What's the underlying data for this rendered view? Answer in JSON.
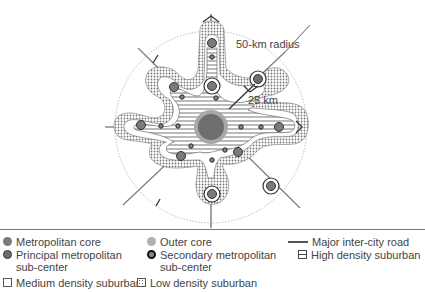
{
  "diagram": {
    "labels": {
      "outer_radius": "50-km radius",
      "inner_radius": "25 km"
    },
    "colors": {
      "metropolitan_core": "#6e6e6e",
      "outer_core": "#a8a8a8",
      "principal_subcenter": "#7a7a7a",
      "road": "#555555",
      "hatch": "#666666",
      "dots": "#888888"
    }
  },
  "legend": {
    "items": [
      {
        "label": "Metropolitan core",
        "icon": "grey-filled-circle"
      },
      {
        "label": "Outer core",
        "icon": "light-grey-circle"
      },
      {
        "label": "Major inter-city road",
        "icon": "horizontal-line"
      },
      {
        "label": "Principal metropolitan sub-center",
        "icon": "dark-ringed-circle"
      },
      {
        "label": "Secondary metropolitan sub-center",
        "icon": "black-ring-circle"
      },
      {
        "label": "High density suburban",
        "icon": "hatched-square"
      },
      {
        "label": "Medium density suburban",
        "icon": "empty-square"
      },
      {
        "label": "Low density suburban",
        "icon": "dotted-square"
      }
    ]
  }
}
